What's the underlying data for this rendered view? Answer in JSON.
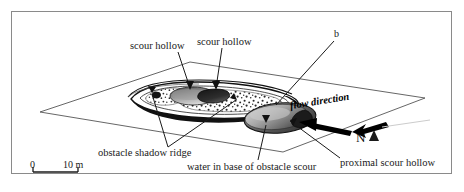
{
  "figure": {
    "type": "block-diagram",
    "background": "#ffffff",
    "frame_color": "#8a8a8a",
    "ink_color": "#1a1a1a"
  },
  "labels": {
    "scour_hollow_left": "scour hollow",
    "scour_hollow_right": "scour hollow",
    "obstacle_marker": "b",
    "flow_direction": "flow direction",
    "north": "N",
    "obstacle_shadow_ridge": "obstacle shadow ridge",
    "water_in_base": "water in base of obstacle scour",
    "proximal_scour_hollow": "proximal scour hollow"
  },
  "scale_bar": {
    "start_label": "0",
    "end_label": "10 m",
    "length_m": 10
  },
  "icons": {
    "north_arrow": "north-arrow-icon",
    "flow_arrow": "flow-direction-arrow-icon"
  },
  "colors": {
    "hollow_dark": "#2b2b2b",
    "hollow_mid": "#8c8c8c",
    "hollow_light": "#cfcfcf",
    "ridge_outline": "#111111",
    "ground_plane_line": "#555555"
  }
}
